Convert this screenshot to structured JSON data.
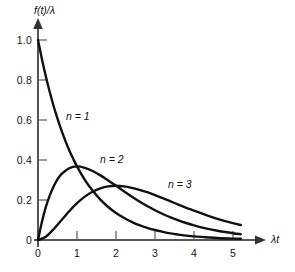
{
  "chart_data": {
    "type": "line",
    "title": "",
    "subtitle": "",
    "xlabel": "λt",
    "ylabel": "f(t)/λ",
    "xlim": [
      0,
      5.45
    ],
    "ylim": [
      0,
      1.05
    ],
    "xticks": [
      "0",
      "1",
      "2",
      "3",
      "4",
      "5"
    ],
    "xtick_values": [
      0,
      1,
      2,
      3,
      4,
      5
    ],
    "yticks": [
      "0",
      "0.2",
      "0.4",
      "0.6",
      "0.8",
      "1.0"
    ],
    "ytick_values": [
      0,
      0.2,
      0.4,
      0.6,
      0.8,
      1.0
    ],
    "grid": false,
    "legend_position": "inline-annotations",
    "line_color": "#111111",
    "axis_color": "#555555",
    "background_color": "#ffffff",
    "annotations": [
      {
        "text": "n = 1",
        "x": 1.0,
        "y": 0.6
      },
      {
        "text": "n = 2",
        "x": 1.85,
        "y": 0.39
      },
      {
        "text": "n = 3",
        "x": 3.45,
        "y": 0.3
      }
    ],
    "series": [
      {
        "name": "n = 1",
        "label": "n = 1",
        "x": [
          0.0,
          0.1,
          0.2,
          0.3,
          0.4,
          0.5,
          0.6,
          0.7,
          0.8,
          0.9,
          1.0,
          1.2,
          1.4,
          1.6,
          1.8,
          2.0,
          2.2,
          2.4,
          2.6,
          2.8,
          3.0,
          3.2,
          3.4,
          3.6,
          3.8,
          4.0,
          4.3,
          4.6,
          5.0,
          5.2
        ],
        "values": [
          1.0,
          0.905,
          0.819,
          0.741,
          0.67,
          0.607,
          0.549,
          0.497,
          0.449,
          0.407,
          0.368,
          0.301,
          0.247,
          0.202,
          0.165,
          0.135,
          0.111,
          0.091,
          0.074,
          0.061,
          0.05,
          0.041,
          0.033,
          0.027,
          0.022,
          0.018,
          0.014,
          0.01,
          0.007,
          0.006
        ]
      },
      {
        "name": "n = 2",
        "label": "n = 2",
        "x": [
          0.0,
          0.1,
          0.2,
          0.3,
          0.4,
          0.5,
          0.6,
          0.8,
          1.0,
          1.2,
          1.4,
          1.6,
          1.8,
          2.0,
          2.2,
          2.4,
          2.6,
          2.8,
          3.0,
          3.2,
          3.4,
          3.6,
          3.8,
          4.0,
          4.3,
          4.6,
          5.0,
          5.2
        ],
        "values": [
          0.0,
          0.09,
          0.164,
          0.222,
          0.268,
          0.303,
          0.329,
          0.359,
          0.368,
          0.361,
          0.345,
          0.323,
          0.298,
          0.271,
          0.244,
          0.218,
          0.193,
          0.17,
          0.149,
          0.13,
          0.113,
          0.098,
          0.085,
          0.073,
          0.058,
          0.046,
          0.034,
          0.029
        ]
      },
      {
        "name": "n = 3",
        "label": "n = 3",
        "x": [
          0.0,
          0.2,
          0.4,
          0.6,
          0.8,
          1.0,
          1.2,
          1.4,
          1.6,
          1.8,
          2.0,
          2.2,
          2.4,
          2.6,
          2.8,
          3.0,
          3.2,
          3.4,
          3.6,
          3.8,
          4.0,
          4.3,
          4.6,
          5.0,
          5.2
        ],
        "values": [
          0.0,
          0.016,
          0.054,
          0.099,
          0.144,
          0.184,
          0.217,
          0.241,
          0.258,
          0.268,
          0.271,
          0.268,
          0.261,
          0.251,
          0.239,
          0.224,
          0.209,
          0.193,
          0.177,
          0.161,
          0.147,
          0.126,
          0.106,
          0.084,
          0.075
        ]
      }
    ]
  },
  "axes": {
    "y_title": "f(t)/λ",
    "x_title": "λt"
  }
}
